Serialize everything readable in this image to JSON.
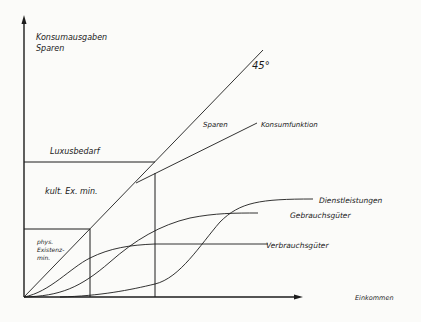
{
  "diagram": {
    "y_axis_label_line1": "Konsumausgaben",
    "y_axis_label_line2": "Sparen",
    "x_axis_label": "Einkommen",
    "angle_label": "45°",
    "region_labels": {
      "luxus": "Luxusbedarf",
      "kult": "kult. Ex. min.",
      "phys_line1": "phys.",
      "phys_line2": "Existenz-",
      "phys_line3": "min."
    },
    "curve_labels": {
      "sparen": "Sparen",
      "konsumfunktion": "Konsumfunktion",
      "dienstleistungen": "Dienstleistungen",
      "gebrauchsgueter": "Gebrauchsgüter",
      "verbrauchsgueter": "Verbrauchsgüter"
    },
    "colors": {
      "ink": "#1c1c1c",
      "paper": "#fbfbf9"
    }
  }
}
